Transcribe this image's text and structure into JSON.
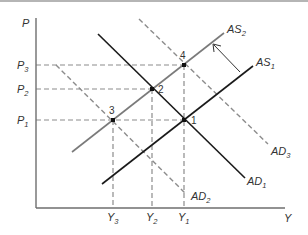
{
  "diagram": {
    "type": "AD-AS model",
    "axes": {
      "y_label": {
        "main": "P",
        "sub": ""
      },
      "x_label": {
        "main": "Y",
        "sub": ""
      }
    },
    "price_levels": [
      {
        "main": "P",
        "sub": "3"
      },
      {
        "main": "P",
        "sub": "2"
      },
      {
        "main": "P",
        "sub": "1"
      }
    ],
    "output_levels": [
      {
        "main": "Y",
        "sub": "3"
      },
      {
        "main": "Y",
        "sub": "2"
      },
      {
        "main": "Y",
        "sub": "1"
      }
    ],
    "curves": {
      "as2": {
        "main": "AS",
        "sub": "2"
      },
      "as1": {
        "main": "AS",
        "sub": "1"
      },
      "ad1": {
        "main": "AD",
        "sub": "1"
      },
      "ad2": {
        "main": "AD",
        "sub": "2"
      },
      "ad3": {
        "main": "AD",
        "sub": "3"
      }
    },
    "points": {
      "p1": "1",
      "p2": "2",
      "p3": "3",
      "p4": "4"
    },
    "colors": {
      "axis": "#6e6e6e",
      "solid_dark": "#1a1a1a",
      "solid_gray": "#7a7a7a",
      "dashed": "#8c8c8c"
    }
  }
}
